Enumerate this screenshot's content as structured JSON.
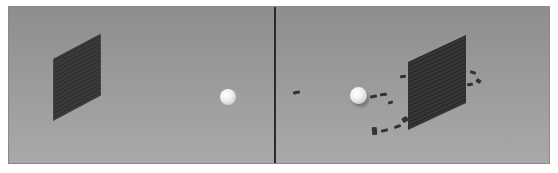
{
  "figure": {
    "panels": [
      {
        "id": "before",
        "description": "Intact brick wall and ball before impact",
        "objects": [
          "brick-wall-intact",
          "ball"
        ]
      },
      {
        "id": "after",
        "description": "Ball after breaking through brick wall with scattered bricks",
        "objects": [
          "brick-wall-broken",
          "ball",
          "scattered-bricks"
        ]
      }
    ],
    "colors": {
      "background_top": "#8e8e8e",
      "background_bottom": "#a9a9a9",
      "brick": "#333333",
      "ball": "#f0f0ec",
      "divider": "#2a2a2a"
    }
  }
}
